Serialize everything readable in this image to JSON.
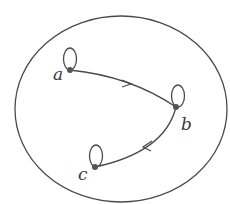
{
  "diagram": {
    "type": "directed-graph",
    "container": {
      "shape": "ellipse",
      "cx": 121,
      "cy": 109,
      "rx": 106,
      "ry": 93
    },
    "colors": {
      "stroke": "#4a4a4a",
      "node": "#555555",
      "label": "#3a3a3a"
    },
    "nodes": [
      {
        "id": "a",
        "label": "a",
        "x": 70,
        "y": 70,
        "self_loop": true,
        "label_x": 53,
        "label_y": 80
      },
      {
        "id": "b",
        "label": "b",
        "x": 176,
        "y": 107,
        "self_loop": true,
        "label_x": 181,
        "label_y": 130
      },
      {
        "id": "c",
        "label": "c",
        "x": 95,
        "y": 167,
        "self_loop": true,
        "label_x": 77,
        "label_y": 180
      }
    ],
    "edges": [
      {
        "from": "a",
        "to": "b",
        "directed": true
      },
      {
        "from": "b",
        "to": "c",
        "directed": true
      },
      {
        "from": "a",
        "to": "a",
        "type": "loop"
      },
      {
        "from": "b",
        "to": "b",
        "type": "loop"
      },
      {
        "from": "c",
        "to": "c",
        "type": "loop"
      }
    ]
  }
}
